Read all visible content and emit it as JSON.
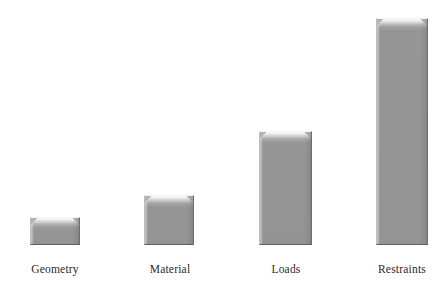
{
  "chart_data": {
    "type": "bar",
    "title": "",
    "subtitle": "",
    "xlabel": "",
    "ylabel": "",
    "grid": false,
    "legend": "none",
    "axis_visible": false,
    "categories": [
      "Geometry",
      "Material",
      "Loads",
      "Restraints"
    ],
    "values": [
      28,
      50,
      114,
      227
    ],
    "value_unit": "pixels (relative bar height)",
    "ylim": [
      0,
      240
    ],
    "series": [
      {
        "name": "",
        "values": [
          28,
          50,
          114,
          227
        ]
      }
    ],
    "bars": [
      {
        "label": "Geometry",
        "value": 28,
        "x": 30,
        "width": 50,
        "top": 217,
        "baseline": 245
      },
      {
        "label": "Material",
        "value": 50,
        "x": 144,
        "width": 50,
        "top": 195,
        "baseline": 245
      },
      {
        "label": "Loads",
        "value": 114,
        "x": 259,
        "width": 53,
        "top": 131,
        "baseline": 245
      },
      {
        "label": "Restraints",
        "value": 227,
        "x": 376,
        "width": 52,
        "top": 18,
        "baseline": 245
      }
    ],
    "label_positions": [
      {
        "label": "Geometry",
        "center_x": 55,
        "top": 262
      },
      {
        "label": "Material",
        "center_x": 170,
        "top": 262
      },
      {
        "label": "Loads",
        "center_x": 286,
        "top": 262
      },
      {
        "label": "Restraints",
        "center_x": 402,
        "top": 262
      }
    ],
    "colors": {
      "background": "#ffffff",
      "bar_body": "#999999",
      "bar_highlight": "#ffffff",
      "bar_shadow": "#5f5f5f",
      "label_text": "#2b2b2b"
    }
  }
}
